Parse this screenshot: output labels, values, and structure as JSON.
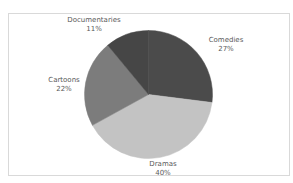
{
  "chart_data": {
    "type": "pie",
    "title": "",
    "start": "12 o'clock",
    "direction": "clockwise",
    "slices": [
      {
        "label": "Comedies",
        "value": 27,
        "pct_label": "27%",
        "color": "#4b4b4b"
      },
      {
        "label": "Dramas",
        "value": 40,
        "pct_label": "40%",
        "color": "#c3c3c3"
      },
      {
        "label": "Cartoons",
        "value": 22,
        "pct_label": "22%",
        "color": "#7c7c7c"
      },
      {
        "label": "Documentaries",
        "value": 11,
        "pct_label": "11%",
        "color": "#464646"
      }
    ],
    "legend": "none",
    "data_labels": "outside, category name and percentage"
  }
}
